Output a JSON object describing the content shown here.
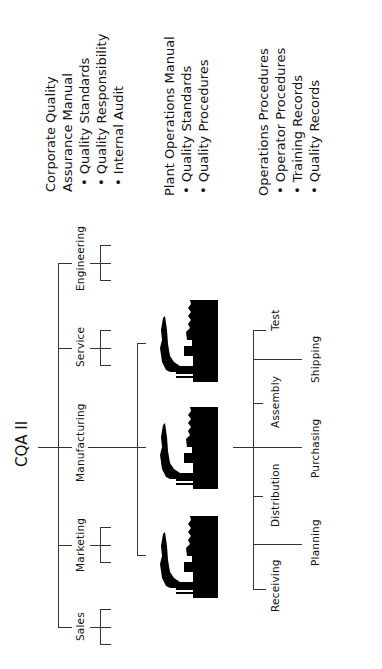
{
  "diagram": {
    "root": "CQA II",
    "departments": [
      "Sales",
      "Marketing",
      "Manufacturing",
      "Service",
      "Engineering"
    ],
    "plants": [
      "plant-1",
      "plant-2",
      "plant-3"
    ],
    "functions_upper": [
      "Receiving",
      "Distribution",
      "Assembly",
      "Test"
    ],
    "functions_lower": [
      "Planning",
      "Purchasing",
      "Shipping"
    ],
    "icon": "factory-icon",
    "colors": {
      "line": "#333333",
      "ink": "#111111",
      "background": "#ffffff"
    }
  },
  "documents": [
    {
      "heading": [
        "Corporate Quality",
        "Assurance Manual"
      ],
      "bullets": [
        "Quality Standards",
        "Quality Responsibility",
        "Internal Audit"
      ]
    },
    {
      "heading": [
        "Plant Operations Manual"
      ],
      "bullets": [
        "Quality Standards",
        "Quality Procedures"
      ]
    },
    {
      "heading": [
        "Operations Procedures"
      ],
      "bullets": [
        "Operator Procedures",
        "Training Records",
        "Quality Records"
      ]
    }
  ]
}
